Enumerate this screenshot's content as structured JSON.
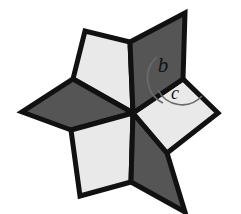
{
  "figure": {
    "name": "six-pointed-pinwheel-star",
    "background_color": "#ffffff",
    "outline_color": "#111111",
    "outline_width": 5,
    "center": {
      "x": 133,
      "y": 113
    },
    "colors": {
      "dark_fill": "#555555",
      "light_fill": "#e9e9e9",
      "arc_stroke": "#6b6b6b",
      "label_color": "#111111"
    },
    "rhombi": [
      {
        "name": "top-right-dark-rhombus",
        "shade": "dark",
        "fill": "#555555",
        "points": "133,113 130,42 185,13 183,79"
      },
      {
        "name": "right-light-rhombus",
        "shade": "light",
        "fill": "#e9e9e9",
        "points": "133,113 183,79 218,113 167,153"
      },
      {
        "name": "bottom-right-dark-rhombus",
        "shade": "dark",
        "fill": "#555555",
        "points": "133,113 167,153 185,212 131,182"
      },
      {
        "name": "bottom-left-light-rhombus",
        "shade": "light",
        "fill": "#e9e9e9",
        "points": "133,113 131,182 80,196 71,130"
      },
      {
        "name": "left-dark-rhombus",
        "shade": "dark",
        "fill": "#555555",
        "points": "133,113 71,130 22,112 73,79"
      },
      {
        "name": "top-left-light-rhombus",
        "shade": "light",
        "fill": "#e9e9e9",
        "points": "133,113 73,79 85,31 130,42"
      }
    ],
    "angles": [
      {
        "name": "angle-b",
        "label": "b",
        "vertex": {
          "x": 183,
          "y": 79
        },
        "label_position": {
          "x": 163,
          "y": 67
        },
        "label_size": 21,
        "arc_radius": 28,
        "arc_path": "M 163,103 A 28 28 0 0 1 157,57"
      },
      {
        "name": "angle-c",
        "label": "c",
        "vertex": {
          "x": 183,
          "y": 79
        },
        "label_position": {
          "x": 175,
          "y": 95
        },
        "label_size": 18,
        "arc_radius": 27,
        "arc_path": "M 158,90 A 27 27 0 0 0 202,96"
      }
    ]
  }
}
